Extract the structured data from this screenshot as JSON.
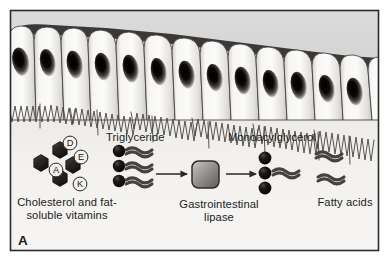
{
  "figure": {
    "panel_letter": "A",
    "frame_color": "#2b2b2b",
    "background_color": "#ffffff",
    "upper_panel_color": "#d9d9d9",
    "lower_panel_color": "#f2f0ed",
    "width": 389,
    "height": 272
  },
  "epithelium": {
    "name": "intestinal epithelial cell layer",
    "cell_count": 13,
    "cell_fill": "#f4f3f1",
    "cell_outline": "#3a3a3a",
    "apical_cap_color": "#3a3733",
    "nucleus_color": "#17130f",
    "microvilli_color": "#4b4845",
    "microvilli_label": "brush border microvilli"
  },
  "molecules": {
    "triglyceride": {
      "label": "Triglyceride",
      "head_count": 3,
      "tail_count": 3,
      "head_color": "#100d0b",
      "tail_color": "#444140"
    },
    "monoacylglycerol": {
      "label": "Monoacylglycerol",
      "head_count": 3,
      "tail_count": 1,
      "head_color": "#100d0b",
      "tail_color": "#444140"
    },
    "fatty_acids": {
      "label": "Fatty acids",
      "tail_count": 2,
      "tail_color": "#444140"
    },
    "cholesterol_vitamins": {
      "label": "Cholesterol and fat-\nsoluble vitamins",
      "hexagon_count": 4,
      "hexagon_color": "#262221",
      "vitamins": [
        {
          "letter": "D",
          "x": 70,
          "y": 136
        },
        {
          "letter": "E",
          "x": 80,
          "y": 150
        },
        {
          "letter": "A",
          "x": 55,
          "y": 163
        },
        {
          "letter": "K",
          "x": 79,
          "y": 177
        }
      ]
    }
  },
  "enzyme": {
    "label": "Gastrointestinal\nlipase",
    "shape": "rounded-square",
    "fill_light": "#b9b7b5",
    "fill_dark": "#6d6b69",
    "outline": "#2e2c2a"
  },
  "arrows": {
    "color": "#2b2927",
    "arrow_1_name": "triglyceride-to-lipase-arrow",
    "arrow_2_name": "lipase-to-products-arrow"
  }
}
